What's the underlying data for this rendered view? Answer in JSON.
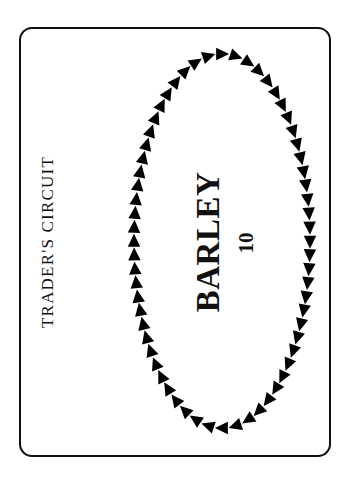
{
  "card": {
    "title": "TRADER'S CIRCUIT",
    "resource": "BARLEY",
    "value": "10",
    "border_color": "#111111"
  },
  "circuit": {
    "shape": "ellipse",
    "direction": "clockwise",
    "icon": "triangle-arrow-icon",
    "arrow_count": 64,
    "center": [
      222,
      241
    ],
    "radii": [
      88,
      187
    ],
    "arrow_size": 13,
    "color": "#000000"
  }
}
